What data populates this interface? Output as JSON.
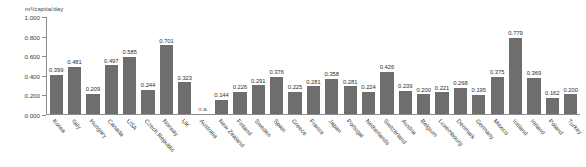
{
  "chart_data": {
    "type": "bar",
    "title": "",
    "subtitle": "",
    "xlabel": "",
    "ylabel": "m³/capita/day",
    "ylim": [
      0.0,
      1.0
    ],
    "ytick_labels": [
      "0.000",
      "0.200",
      "0.400",
      "0.600",
      "0.800",
      "1.000"
    ],
    "ytick_values": [
      0.0,
      0.2,
      0.4,
      0.6,
      0.8,
      1.0
    ],
    "grid": false,
    "legend": null,
    "bar_color": "#6e6e6e",
    "categories": [
      "Korea",
      "Italy",
      "Hungary",
      "Canada",
      "USA",
      "Czech Republic",
      "Norway",
      "UK",
      "Australia",
      "New Zealand",
      "Finland",
      "Sweden",
      "Spain",
      "Greece",
      "France",
      "Japan",
      "Portugal",
      "Netherlands",
      "Switzerland",
      "Austria",
      "Belgium",
      "Luxembourg",
      "Denmark",
      "Germany",
      "Mexico",
      "Iceland",
      "Ireland",
      "Poland",
      "Turkey"
    ],
    "values": [
      0.399,
      0.481,
      0.209,
      0.497,
      0.585,
      0.244,
      0.701,
      0.323,
      null,
      0.144,
      0.226,
      0.291,
      0.376,
      0.225,
      0.281,
      0.358,
      0.281,
      0.224,
      0.426,
      0.239,
      0.2,
      0.221,
      0.268,
      0.195,
      0.375,
      0.779,
      0.369,
      0.162,
      0.2
    ],
    "value_labels": [
      "0.399",
      "0.481",
      "0.209",
      "0.497",
      "0.585",
      "0.244",
      "0.701",
      "0.323",
      "n.a.",
      "0.144",
      "0.226",
      "0.291",
      "0.376",
      "0.225",
      "0.281",
      "0.358",
      "0.281",
      "0.224",
      "0.426",
      "0.239",
      "0.200",
      "0.221",
      "0.268",
      "0.195",
      "0.375",
      "0.779",
      "0.369",
      "0.162",
      "0.200"
    ]
  }
}
